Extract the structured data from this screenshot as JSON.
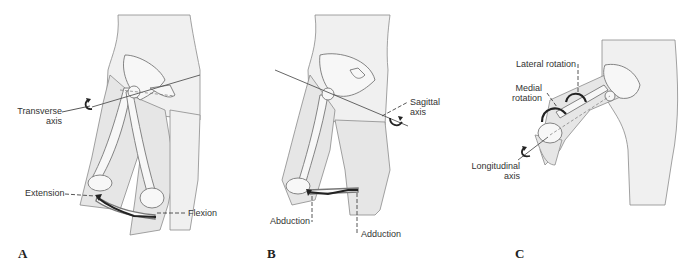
{
  "figure": {
    "panels": [
      {
        "id": "A",
        "letter": "A",
        "axis_label_line1": "Transverse",
        "axis_label_line2": "axis",
        "motion_labels": [
          "Extension",
          "Flexion"
        ]
      },
      {
        "id": "B",
        "letter": "B",
        "axis_label_line1": "Sagittal",
        "axis_label_line2": "axis",
        "motion_labels": [
          "Abduction",
          "Adduction"
        ]
      },
      {
        "id": "C",
        "letter": "C",
        "axis_label_line1": "Longitudinal",
        "axis_label_line2": "axis",
        "motion_labels": [
          "Lateral rotation",
          "Medial",
          "rotation"
        ]
      }
    ],
    "colors": {
      "background": "#ffffff",
      "skin_fill": "#e6e6e6",
      "outline": "#8a8a8a",
      "arrow": "#222222",
      "text": "#333333"
    }
  }
}
